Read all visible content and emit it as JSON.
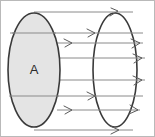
{
  "figure": {
    "background_color": "#ffffff",
    "frame": {
      "visible": true,
      "color": "#b9b9b9",
      "width": 155,
      "height": 137
    },
    "labels": {
      "area": "A"
    },
    "colors": {
      "surface_fill": "#e4e4e4",
      "surface_stroke": "#3a3a3a",
      "field_line": "#8a8a8a",
      "arrow_head": "#5a5a5a",
      "label_text": "#2b2b2b"
    },
    "shapes": {
      "left_ellipse": {
        "name": "area-A-surface",
        "cx": 34,
        "cy": 70,
        "rx": 26,
        "ry": 57,
        "filled": true
      },
      "right_ellipse": {
        "name": "exit-surface",
        "cx": 115,
        "cy": 70,
        "rx": 22,
        "ry": 57,
        "filled": false
      }
    },
    "field_lines": [
      {
        "y": 12,
        "x1": 34,
        "x2": 133,
        "head_x": 117,
        "head_dir": "up-right"
      },
      {
        "y": 33,
        "x1": 10,
        "x2": 143,
        "head_x": 93,
        "head_dir": "down-right"
      },
      {
        "y": 43,
        "x1": 57,
        "x2": 143,
        "head_x": 138,
        "head_dir": "down-right"
      },
      {
        "y": 58,
        "x1": 57,
        "x2": 145,
        "head_x": 140,
        "head_dir": "down-right"
      },
      {
        "y": 80,
        "x1": 57,
        "x2": 145,
        "head_x": 140,
        "head_dir": "down-right"
      },
      {
        "y": 96,
        "x1": 10,
        "x2": 143,
        "head_x": 93,
        "head_dir": "down-right"
      },
      {
        "y": 110,
        "x1": 57,
        "x2": 140,
        "head_x": 135,
        "head_dir": "up-right"
      },
      {
        "y": 130,
        "x1": 34,
        "x2": 133,
        "head_x": 117,
        "head_dir": "down-right"
      }
    ],
    "field_line_count": 8
  }
}
